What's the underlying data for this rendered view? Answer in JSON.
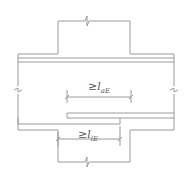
{
  "diagram": {
    "label_top": {
      "prefix": "≥",
      "var": "l",
      "sub": "aE"
    },
    "label_bottom": {
      "prefix": "≥",
      "var": "l",
      "sub": "lE"
    },
    "line_color": "#9a9a9a"
  }
}
